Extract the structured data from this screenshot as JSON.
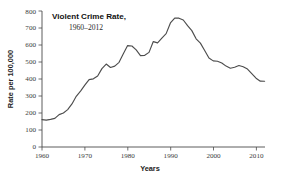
{
  "chart_data": {
    "type": "line",
    "title": "Violent Crime Rate,",
    "subtitle": "1960–2012",
    "xlabel": "Years",
    "ylabel": "Rate per 100,000",
    "xlim": [
      1960,
      2012
    ],
    "ylim": [
      0,
      800
    ],
    "grid": false,
    "legend": false,
    "xticks": [
      1960,
      1970,
      1980,
      1990,
      2000,
      2010
    ],
    "xtick_labels": [
      "1960",
      "1970",
      "1980",
      "1990",
      "2000",
      "2010"
    ],
    "yticks": [
      0,
      100,
      200,
      300,
      400,
      500,
      600,
      700,
      800
    ],
    "ytick_labels": [
      "0",
      "100",
      "200",
      "300",
      "400",
      "500",
      "600",
      "700",
      "800"
    ],
    "line_color": "#4d4d4d",
    "x": [
      1960,
      1961,
      1962,
      1963,
      1964,
      1965,
      1966,
      1967,
      1968,
      1969,
      1970,
      1971,
      1972,
      1973,
      1974,
      1975,
      1976,
      1977,
      1978,
      1979,
      1980,
      1981,
      1982,
      1983,
      1984,
      1985,
      1986,
      1987,
      1988,
      1989,
      1990,
      1991,
      1992,
      1993,
      1994,
      1995,
      1996,
      1997,
      1998,
      1999,
      2000,
      2001,
      2002,
      2003,
      2004,
      2005,
      2006,
      2007,
      2008,
      2009,
      2010,
      2011,
      2012
    ],
    "values": [
      160.9,
      158.1,
      162.3,
      168.2,
      190.6,
      200.2,
      220.0,
      253.2,
      298.4,
      328.7,
      363.5,
      396.0,
      401.0,
      417.4,
      461.1,
      487.8,
      467.8,
      475.9,
      497.8,
      548.9,
      596.6,
      594.3,
      571.1,
      537.7,
      539.2,
      556.6,
      620.1,
      612.5,
      640.6,
      666.9,
      729.6,
      758.2,
      757.7,
      747.1,
      713.6,
      684.5,
      636.6,
      611.0,
      567.6,
      523.0,
      506.5,
      504.5,
      494.4,
      475.8,
      463.2,
      469.0,
      479.3,
      471.8,
      458.6,
      431.9,
      404.5,
      387.1,
      386.9
    ],
    "series_name": "Violent Crime Rate"
  }
}
